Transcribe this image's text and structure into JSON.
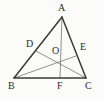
{
  "figure": {
    "kind": "plane-geometry-diagram",
    "shape": "triangle",
    "background_color": "#fbfbf9",
    "stroke_color_outline": "#3a3a3a",
    "stroke_color_cevian": "#6e6e6e",
    "label_color": "#2b2b2b",
    "points": [
      {
        "id": "A",
        "label": "A",
        "x": 62,
        "y": 17,
        "label_x": 58,
        "label_y": 3,
        "role": "apex-vertex"
      },
      {
        "id": "B",
        "label": "B",
        "x": 14,
        "y": 78,
        "label_x": 8,
        "label_y": 81,
        "role": "base-left-vertex"
      },
      {
        "id": "C",
        "label": "C",
        "x": 86,
        "y": 78,
        "label_x": 85,
        "label_y": 81,
        "role": "base-right-vertex"
      },
      {
        "id": "D",
        "label": "D",
        "x": 36,
        "y": 51,
        "label_x": 26,
        "label_y": 39,
        "role": "point-on-side-AB"
      },
      {
        "id": "E",
        "label": "E",
        "x": 76,
        "y": 56,
        "label_x": 80,
        "label_y": 42,
        "role": "point-on-side-AC"
      },
      {
        "id": "F",
        "label": "F",
        "x": 60,
        "y": 78,
        "label_x": 57,
        "label_y": 81,
        "role": "point-on-side-BC"
      },
      {
        "id": "O",
        "label": "O",
        "x": 59,
        "y": 58,
        "label_x": 52,
        "label_y": 46,
        "role": "cevian-intersection"
      }
    ],
    "segments": [
      {
        "id": "AB",
        "from": "A",
        "to": "B",
        "kind": "triangle-side"
      },
      {
        "id": "AC",
        "from": "A",
        "to": "C",
        "kind": "triangle-side"
      },
      {
        "id": "BC",
        "from": "B",
        "to": "C",
        "kind": "triangle-side"
      },
      {
        "id": "AF",
        "from": "A",
        "to": "F",
        "kind": "cevian"
      },
      {
        "id": "BE",
        "from": "B",
        "to": "E",
        "kind": "cevian"
      },
      {
        "id": "CD",
        "from": "C",
        "to": "D",
        "kind": "cevian"
      }
    ]
  }
}
